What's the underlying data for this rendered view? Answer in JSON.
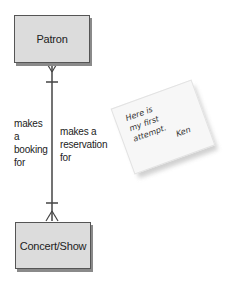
{
  "entities": {
    "patron": "Patron",
    "concert": "Concert/Show"
  },
  "relationship": {
    "label_left": "makes a booking for",
    "label_right": "makes a reservation for",
    "line_color": "#444444"
  },
  "note": {
    "lines": [
      "Here is",
      "my first",
      "attempt."
    ],
    "signature": "Ken"
  }
}
